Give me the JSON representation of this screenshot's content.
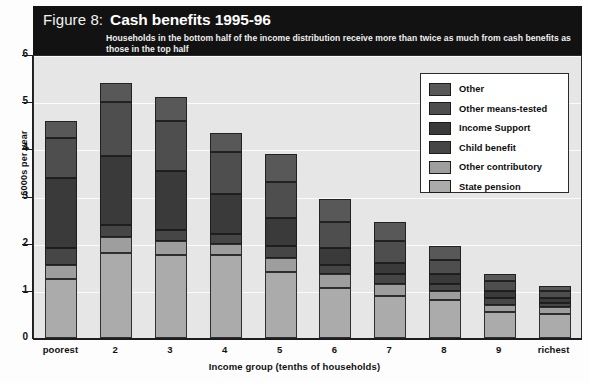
{
  "figure": {
    "number_label": "Figure 8:",
    "title": "Cash benefits 1995-96",
    "subtitle": "Households in the bottom half of the income distribution receive more than twice as much from cash benefits as those in the top half"
  },
  "colors": {
    "banner_bg": "#121212",
    "plot_bg": "#e6e6e6",
    "gridline": "#fbfbfb",
    "axis": "#1d1d1d",
    "other": "#585858",
    "other_means_tested": "#4e4e4e",
    "income_support": "#3a3a3a",
    "child_benefit": "#464646",
    "other_contributory": "#9e9e9e",
    "state_pension": "#ababab"
  },
  "chart_data": {
    "type": "bar",
    "stacked": true,
    "title": "Cash benefits 1995-96",
    "subtitle": "Households in the bottom half of the income distribution receive more than twice as much from cash benefits as those in the top half",
    "xlabel": "Income group (tenths of households)",
    "ylabel": "£000s per year",
    "ylim": [
      0,
      6
    ],
    "yticks": [
      0,
      1,
      2,
      3,
      4,
      5,
      6
    ],
    "ytick_labels": [
      "0",
      "1",
      "2",
      "3",
      "4",
      "5",
      "6"
    ],
    "grid": true,
    "legend_position": "upper right",
    "categories": [
      "poorest",
      "2",
      "3",
      "4",
      "5",
      "6",
      "7",
      "8",
      "9",
      "richest"
    ],
    "series": [
      {
        "name": "State pension",
        "color": "#ababab",
        "values": [
          1.25,
          1.8,
          1.75,
          1.75,
          1.4,
          1.05,
          0.9,
          0.8,
          0.55,
          0.5
        ]
      },
      {
        "name": "Other contributory",
        "color": "#9e9e9e",
        "values": [
          0.3,
          0.35,
          0.3,
          0.25,
          0.3,
          0.3,
          0.25,
          0.2,
          0.15,
          0.15
        ]
      },
      {
        "name": "Child benefit",
        "color": "#464646",
        "values": [
          0.35,
          0.25,
          0.25,
          0.2,
          0.25,
          0.2,
          0.2,
          0.15,
          0.15,
          0.1
        ]
      },
      {
        "name": "Income Support",
        "color": "#3a3a3a",
        "values": [
          1.5,
          1.45,
          1.25,
          0.85,
          0.6,
          0.35,
          0.25,
          0.2,
          0.15,
          0.1
        ]
      },
      {
        "name": "Other means-tested",
        "color": "#4e4e4e",
        "values": [
          0.85,
          1.15,
          1.05,
          0.9,
          0.75,
          0.55,
          0.45,
          0.3,
          0.2,
          0.15
        ]
      },
      {
        "name": "Other",
        "color": "#585858",
        "values": [
          0.35,
          0.4,
          0.5,
          0.4,
          0.6,
          0.5,
          0.4,
          0.3,
          0.15,
          0.1
        ]
      }
    ],
    "totals": [
      4.6,
      5.4,
      5.1,
      4.35,
      3.9,
      2.95,
      2.45,
      1.95,
      1.35,
      1.1
    ]
  },
  "legend": {
    "items": [
      {
        "label": "Other",
        "color": "#585858"
      },
      {
        "label": "Other means-tested",
        "color": "#4e4e4e"
      },
      {
        "label": "Income Support",
        "color": "#3a3a3a"
      },
      {
        "label": "Child benefit",
        "color": "#464646"
      },
      {
        "label": "Other contributory",
        "color": "#9e9e9e"
      },
      {
        "label": "State pension",
        "color": "#ababab"
      }
    ]
  }
}
